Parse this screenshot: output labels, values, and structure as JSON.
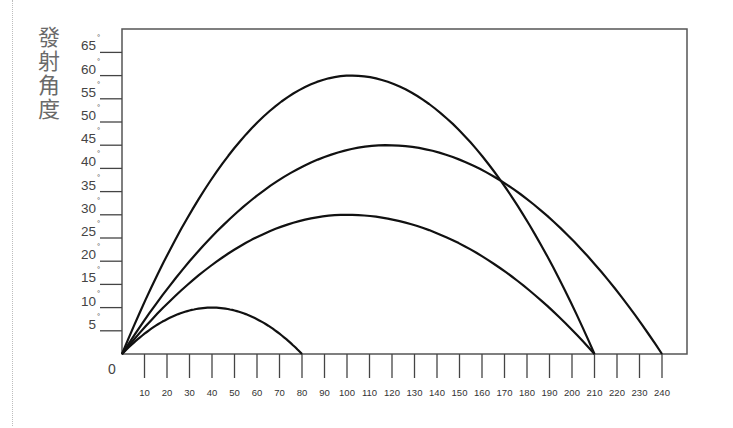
{
  "chart_data": {
    "type": "line",
    "title": "",
    "ylabel": "發射角度",
    "xlabel": "",
    "origin_label": "0",
    "xlim": [
      0,
      240
    ],
    "ylim": [
      0,
      65
    ],
    "x_ticks": [
      10,
      20,
      30,
      40,
      50,
      60,
      70,
      80,
      90,
      100,
      110,
      120,
      130,
      140,
      150,
      160,
      170,
      180,
      190,
      200,
      210,
      220,
      230,
      240
    ],
    "y_ticks": [
      5,
      10,
      15,
      20,
      25,
      30,
      35,
      40,
      45,
      50,
      55,
      60,
      65
    ],
    "y_tick_suffix": "°",
    "grid": false,
    "legend": null,
    "series": [
      {
        "name": "10°",
        "start": 0,
        "end": 80,
        "peak_x": 40,
        "peak_y": 10
      },
      {
        "name": "30°",
        "start": 0,
        "end": 210,
        "peak_x": 100,
        "peak_y": 30
      },
      {
        "name": "45°",
        "start": 0,
        "end": 240,
        "peak_x": 118,
        "peak_y": 45
      },
      {
        "name": "60°",
        "start": 0,
        "end": 210,
        "peak_x": 102,
        "peak_y": 60
      }
    ]
  }
}
